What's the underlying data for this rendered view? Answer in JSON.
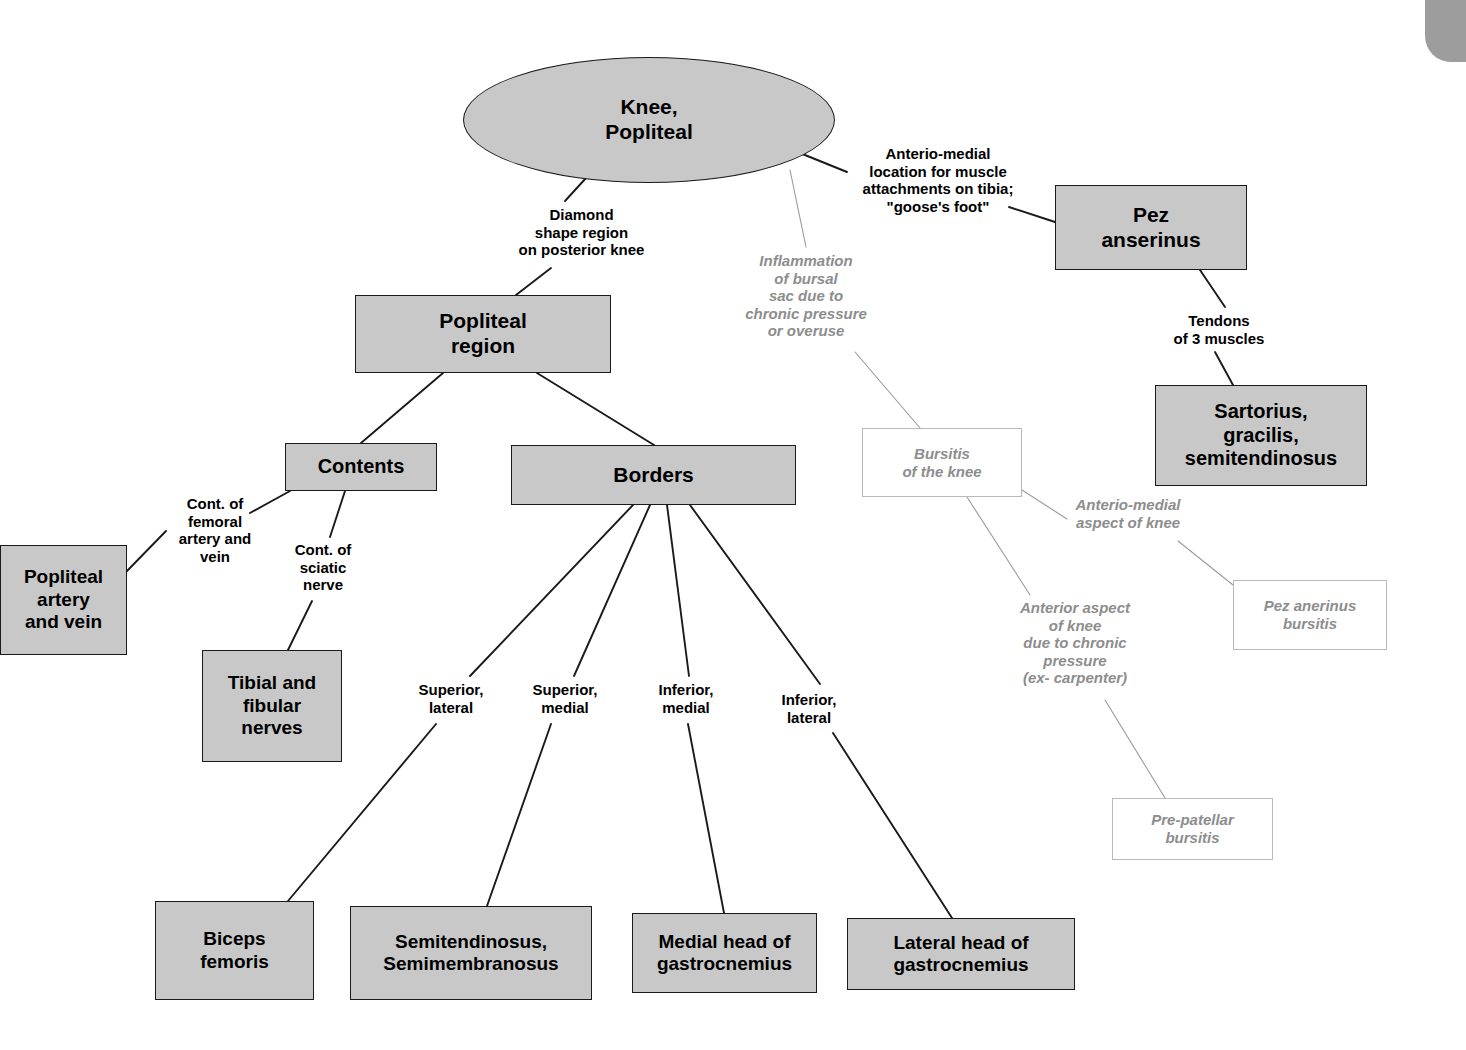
{
  "diagram": {
    "colors": {
      "node_fill": "#c8c8c8",
      "node_border": "#1a1a1a",
      "ghost_text": "#8d8d8d",
      "ghost_border": "#b9b9b9",
      "edge_solid": "#1a1a1a",
      "edge_ghost": "#9a9a9a",
      "background": "#ffffff",
      "corner_tab": "#9d9d9d"
    },
    "nodes": [
      {
        "id": "knee_popliteal",
        "label": "Knee,\nPopliteal",
        "shape": "ellipse",
        "style": "solid",
        "x": 463,
        "y": 57,
        "w": 372,
        "h": 126,
        "font": 21
      },
      {
        "id": "pez_anserinus",
        "label": "Pez\nanserinus",
        "shape": "rect",
        "style": "solid",
        "x": 1055,
        "y": 185,
        "w": 192,
        "h": 85,
        "font": 21
      },
      {
        "id": "popliteal_region",
        "label": "Popliteal\nregion",
        "shape": "rect",
        "style": "solid",
        "x": 355,
        "y": 295,
        "w": 256,
        "h": 78,
        "font": 21
      },
      {
        "id": "sartorius_group",
        "label": "Sartorius,\ngracilis,\nsemitendinosus",
        "shape": "rect",
        "style": "solid",
        "x": 1155,
        "y": 385,
        "w": 212,
        "h": 101,
        "font": 20
      },
      {
        "id": "contents",
        "label": "Contents",
        "shape": "rect",
        "style": "solid",
        "x": 285,
        "y": 443,
        "w": 152,
        "h": 48,
        "font": 20
      },
      {
        "id": "borders",
        "label": "Borders",
        "shape": "rect",
        "style": "solid",
        "x": 511,
        "y": 445,
        "w": 285,
        "h": 60,
        "font": 21
      },
      {
        "id": "bursitis_knee",
        "label": "Bursitis\nof the knee",
        "shape": "rect",
        "style": "ghost",
        "x": 862,
        "y": 428,
        "w": 160,
        "h": 69,
        "font": 15
      },
      {
        "id": "popliteal_artery_vein",
        "label": "Popliteal\nartery\nand vein",
        "shape": "rect",
        "style": "solid",
        "x": 0,
        "y": 545,
        "w": 127,
        "h": 110,
        "font": 19
      },
      {
        "id": "pez_anserinus_bursitis",
        "label": "Pez anerinus\nbursitis",
        "shape": "ghost",
        "style": "ghost",
        "x": 1233,
        "y": 580,
        "w": 154,
        "h": 70,
        "font": 15
      },
      {
        "id": "tibial_fibular_nerves",
        "label": "Tibial and\nfibular\nnerves",
        "shape": "rect",
        "style": "solid",
        "x": 202,
        "y": 650,
        "w": 140,
        "h": 112,
        "font": 19
      },
      {
        "id": "prepatellar_bursitis",
        "label": "Pre-patellar\nbursitis",
        "shape": "ghost",
        "style": "ghost",
        "x": 1112,
        "y": 798,
        "w": 161,
        "h": 62,
        "font": 15
      },
      {
        "id": "biceps_femoris",
        "label": "Biceps\nfemoris",
        "shape": "rect",
        "style": "solid",
        "x": 155,
        "y": 901,
        "w": 159,
        "h": 99,
        "font": 19
      },
      {
        "id": "semitendinosus_semimembranosus",
        "label": "Semitendinosus,\nSemimembranosus",
        "shape": "rect",
        "style": "solid",
        "x": 350,
        "y": 906,
        "w": 242,
        "h": 94,
        "font": 19
      },
      {
        "id": "medial_head_gastrocnemius",
        "label": "Medial head of\ngastrocnemius",
        "shape": "rect",
        "style": "solid",
        "x": 632,
        "y": 913,
        "w": 185,
        "h": 80,
        "font": 19
      },
      {
        "id": "lateral_head_gastrocnemius",
        "label": "Lateral head of\ngastrocnemius",
        "shape": "rect",
        "style": "solid",
        "x": 847,
        "y": 918,
        "w": 228,
        "h": 72,
        "font": 19
      }
    ],
    "edge_labels": [
      {
        "id": "diamond_shape",
        "text": "Diamond\nshape region\non posterior knee",
        "style": "solid",
        "x": 494,
        "y": 206,
        "w": 175,
        "h": 58,
        "font": 15
      },
      {
        "id": "anterio_medial_location",
        "text": "Anterio-medial\nlocation for muscle\nattachments on tibia;\n\"goose's foot\"",
        "style": "solid",
        "x": 843,
        "y": 145,
        "w": 190,
        "h": 78,
        "font": 15
      },
      {
        "id": "inflammation_bursal",
        "text": "Inflammation\nof bursal\nsac due to\nchronic pressure\nor overuse",
        "style": "ghost",
        "x": 725,
        "y": 252,
        "w": 162,
        "h": 95,
        "font": 15
      },
      {
        "id": "tendons_3_muscles",
        "text": "Tendons\nof 3 muscles",
        "style": "solid",
        "x": 1157,
        "y": 312,
        "w": 124,
        "h": 38,
        "font": 15
      },
      {
        "id": "cont_femoral",
        "text": "Cont. of\nfemoral\nartery and\nvein",
        "style": "solid",
        "x": 166,
        "y": 495,
        "w": 98,
        "h": 76,
        "font": 15
      },
      {
        "id": "cont_sciatic",
        "text": "Cont. of\nsciatic\nnerve",
        "style": "solid",
        "x": 283,
        "y": 541,
        "w": 80,
        "h": 58,
        "font": 15
      },
      {
        "id": "anterio_medial_aspect",
        "text": "Anterio-medial\naspect of knee",
        "style": "ghost",
        "x": 1053,
        "y": 496,
        "w": 150,
        "h": 40,
        "font": 15
      },
      {
        "id": "anterior_aspect_chronic",
        "text": "Anterior aspect\nof knee\ndue to chronic\npressure\n(ex- carpenter)",
        "style": "ghost",
        "x": 995,
        "y": 599,
        "w": 160,
        "h": 96,
        "font": 15
      },
      {
        "id": "superior_lateral",
        "text": "Superior,\nlateral",
        "style": "solid",
        "x": 410,
        "y": 681,
        "w": 82,
        "h": 38,
        "font": 15
      },
      {
        "id": "superior_medial",
        "text": "Superior,\nmedial",
        "style": "solid",
        "x": 524,
        "y": 681,
        "w": 82,
        "h": 38,
        "font": 15
      },
      {
        "id": "inferior_medial",
        "text": "Inferior,\nmedial",
        "style": "solid",
        "x": 648,
        "y": 681,
        "w": 76,
        "h": 38,
        "font": 15
      },
      {
        "id": "inferior_lateral",
        "text": "Inferior,\nlateral",
        "style": "solid",
        "x": 772,
        "y": 691,
        "w": 74,
        "h": 38,
        "font": 15
      }
    ],
    "edges": [
      {
        "id": "knee-to-diamond",
        "from": "knee_popliteal",
        "to": "diamond_shape",
        "style": "solid",
        "points": "597,166 565,201"
      },
      {
        "id": "diamond-to-popliteal-region",
        "from": "diamond_shape",
        "to": "popliteal_region",
        "style": "solid",
        "points": "551,268 516,295"
      },
      {
        "id": "knee-to-anterio-medial",
        "from": "knee_popliteal",
        "to": "anterio_medial_location",
        "style": "solid",
        "points": "800,153 847,172"
      },
      {
        "id": "anterio-medial-to-pez",
        "from": "anterio_medial_location",
        "to": "pez_anserinus",
        "style": "solid",
        "points": "1009,207 1055,222"
      },
      {
        "id": "knee-to-inflammation",
        "from": "knee_popliteal",
        "to": "inflammation_bursal",
        "style": "ghost",
        "points": "790,170 806,247"
      },
      {
        "id": "inflammation-to-bursitis",
        "from": "inflammation_bursal",
        "to": "bursitis_knee",
        "style": "ghost",
        "points": "855,352 920,428"
      },
      {
        "id": "pez-to-tendons",
        "from": "pez_anserinus",
        "to": "tendons_3_muscles",
        "style": "solid",
        "points": "1200,270 1225,307"
      },
      {
        "id": "tendons-to-sartorius",
        "from": "tendons_3_muscles",
        "to": "sartorius_group",
        "style": "solid",
        "points": "1215,352 1233,385"
      },
      {
        "id": "popliteal-region-to-contents",
        "from": "popliteal_region",
        "to": "contents",
        "style": "solid",
        "points": "443,373 361,443"
      },
      {
        "id": "popliteal-region-to-borders",
        "from": "popliteal_region",
        "to": "borders",
        "style": "solid",
        "points": "537,373 654,445"
      },
      {
        "id": "contents-to-cont-femoral",
        "from": "contents",
        "to": "cont_femoral",
        "style": "solid",
        "points": "290,491 250,513"
      },
      {
        "id": "cont-femoral-to-artery",
        "from": "cont_femoral",
        "to": "popliteal_artery_vein",
        "style": "solid",
        "points": "166,531 127,571"
      },
      {
        "id": "contents-to-cont-sciatic",
        "from": "contents",
        "to": "cont_sciatic",
        "style": "solid",
        "points": "345,491 330,537"
      },
      {
        "id": "cont-sciatic-to-tibial",
        "from": "cont_sciatic",
        "to": "tibial_fibular_nerves",
        "style": "solid",
        "points": "312,601 288,650"
      },
      {
        "id": "bursitis-to-anterio-medial-aspect",
        "from": "bursitis_knee",
        "to": "anterio_medial_aspect",
        "style": "ghost",
        "points": "1022,490 1067,519"
      },
      {
        "id": "anterio-medial-aspect-to-pez-bursitis",
        "from": "anterio_medial_aspect",
        "to": "pez_anserinus_bursitis",
        "style": "ghost",
        "points": "1178,541 1233,585"
      },
      {
        "id": "bursitis-to-anterior-aspect",
        "from": "bursitis_knee",
        "to": "anterior_aspect_chronic",
        "style": "ghost",
        "points": "967,497 1030,595"
      },
      {
        "id": "anterior-aspect-to-prepatellar",
        "from": "anterior_aspect_chronic",
        "to": "prepatellar_bursitis",
        "style": "ghost",
        "points": "1105,700 1165,798"
      },
      {
        "id": "borders-to-superior-lateral",
        "from": "borders",
        "to": "superior_lateral",
        "style": "solid",
        "points": "633,505 470,676"
      },
      {
        "id": "superior-lateral-to-biceps",
        "from": "superior_lateral",
        "to": "biceps_femoris",
        "style": "solid",
        "points": "436,724 288,901"
      },
      {
        "id": "borders-to-superior-medial",
        "from": "borders",
        "to": "superior_medial",
        "style": "solid",
        "points": "650,505 574,676"
      },
      {
        "id": "superior-medial-to-semitendinosus",
        "from": "superior_medial",
        "to": "semitendinosus_semimembranosus",
        "style": "solid",
        "points": "551,724 487,906"
      },
      {
        "id": "borders-to-inferior-medial",
        "from": "borders",
        "to": "inferior_medial",
        "style": "solid",
        "points": "667,505 689,676"
      },
      {
        "id": "inferior-medial-to-medial-head",
        "from": "inferior_medial",
        "to": "medial_head_gastrocnemius",
        "style": "solid",
        "points": "688,724 724,913"
      },
      {
        "id": "borders-to-inferior-lateral",
        "from": "borders",
        "to": "inferior_lateral",
        "style": "solid",
        "points": "690,505 820,684"
      },
      {
        "id": "inferior-lateral-to-lateral-head",
        "from": "inferior_lateral",
        "to": "lateral_head_gastrocnemius",
        "style": "solid",
        "points": "833,733 952,918"
      }
    ],
    "corner_tab": {
      "id": "corner-tab",
      "x": 1425,
      "y": 0,
      "w": 41,
      "h": 62
    }
  }
}
